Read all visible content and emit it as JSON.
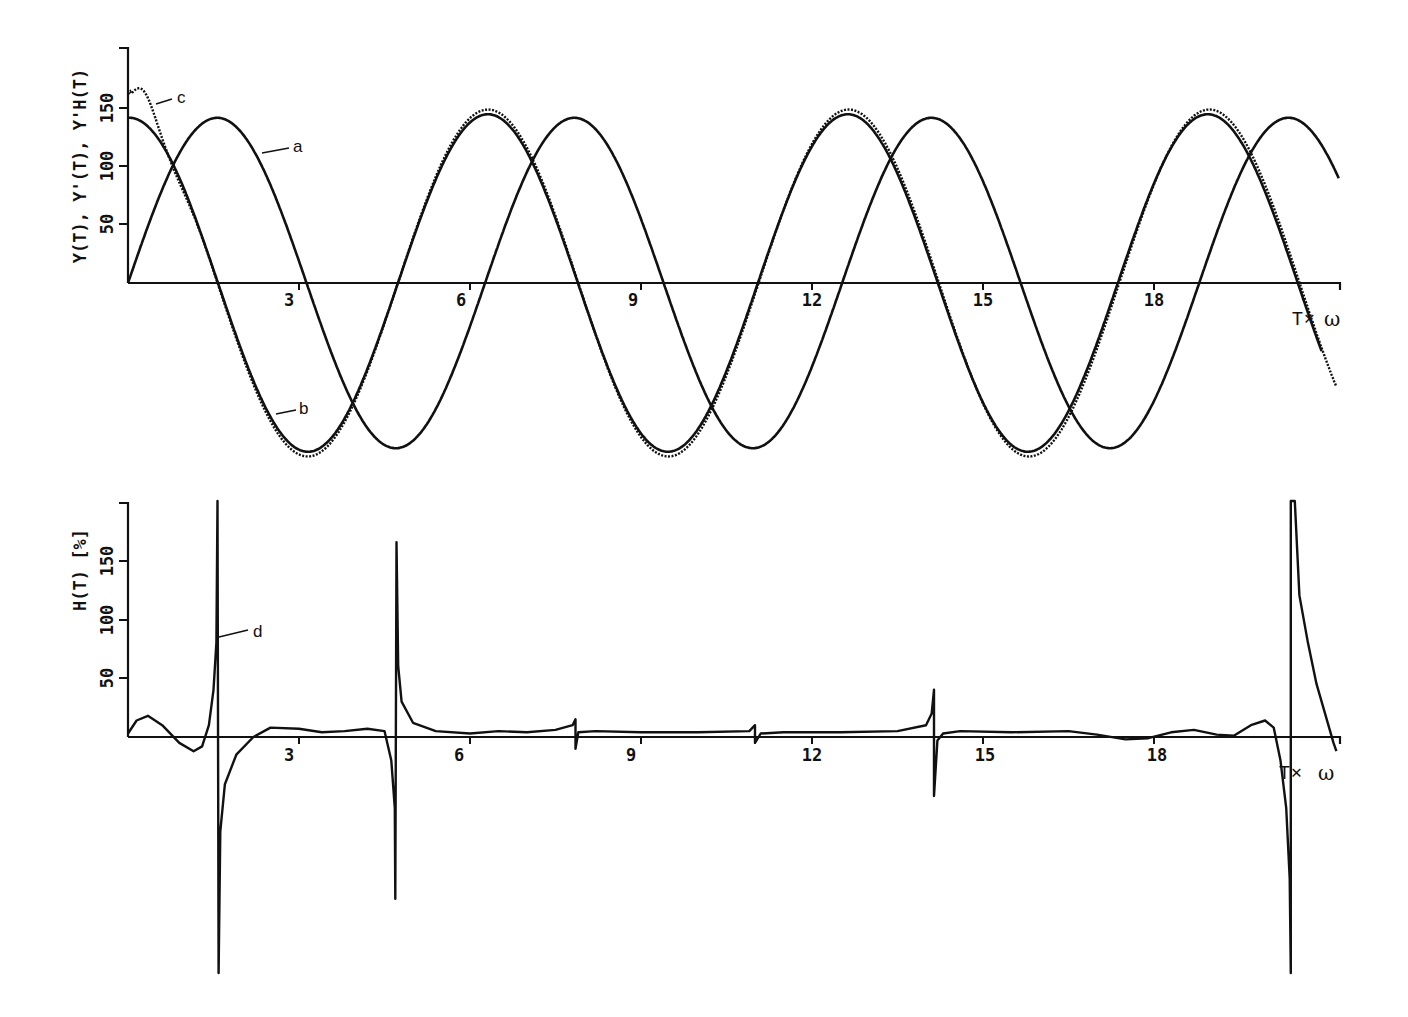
{
  "figure": {
    "top_panel": {
      "ylabel": "Y(T), Y'(T), Y'H(T)",
      "xlabel_left": "T",
      "xlabel_op": "✕",
      "xlabel_right": "ω",
      "yticks": [
        "50",
        "100",
        "150"
      ],
      "xticks": [
        "3",
        "6",
        "9",
        "12",
        "15",
        "18"
      ],
      "curve_labels": {
        "a": "a",
        "b": "b",
        "c": "c"
      }
    },
    "bottom_panel": {
      "ylabel": "H(T) [%]",
      "xlabel_left": "T",
      "xlabel_op": "✕",
      "xlabel_right": "ω",
      "yticks": [
        "50",
        "100",
        "150"
      ],
      "xticks": [
        "3",
        "6",
        "9",
        "12",
        "15",
        "18"
      ],
      "curve_labels": {
        "d": "d"
      }
    }
  },
  "chart_data": [
    {
      "type": "line",
      "title": "",
      "xlabel": "T × ω",
      "ylabel": "Y(T), Y'(T), Y'H(T)",
      "xlim": [
        0,
        21.3
      ],
      "ylim": [
        -150,
        200
      ],
      "xticks": [
        3,
        6,
        9,
        12,
        15,
        18
      ],
      "yticks": [
        50,
        100,
        150
      ],
      "grid": false,
      "legend": "inline labels a, b, c",
      "series": [
        {
          "name": "a",
          "style": "solid",
          "description": "≈ 140·sin(t)",
          "amplitude": 140,
          "x": [
            0,
            1.57,
            3.14,
            4.71,
            6.28,
            7.85,
            9.42,
            11.0,
            12.57,
            14.14,
            15.71,
            17.28,
            18.85,
            20.42,
            21.2
          ],
          "y": [
            0,
            140,
            0,
            -140,
            0,
            140,
            0,
            -140,
            0,
            140,
            0,
            -140,
            0,
            140,
            118
          ]
        },
        {
          "name": "b",
          "style": "solid",
          "description": "≈ 140·cos(t), peaks ≈ 140–145",
          "amplitude": 143,
          "x": [
            0,
            1.57,
            3.2,
            4.71,
            6.35,
            7.85,
            9.45,
            11.0,
            12.6,
            14.14,
            15.75,
            17.28,
            18.9,
            20.42,
            21.2
          ],
          "y": [
            140,
            0,
            -143,
            0,
            143,
            0,
            -143,
            0,
            143,
            0,
            -143,
            0,
            143,
            0,
            -60
          ]
        },
        {
          "name": "c",
          "style": "dotted",
          "description": "approximation, overshoot at start ≈ 160",
          "x": [
            0,
            0.25,
            0.6,
            1.57,
            3.2,
            4.71,
            6.3,
            7.85,
            9.4,
            11.0,
            12.55,
            14.14,
            15.7,
            17.28,
            18.8,
            20.42,
            21.2
          ],
          "y": [
            150,
            160,
            140,
            0,
            -148,
            0,
            147,
            0,
            -147,
            0,
            147,
            0,
            -147,
            0,
            147,
            0,
            -75
          ]
        }
      ]
    },
    {
      "type": "line",
      "title": "",
      "xlabel": "T × ω",
      "ylabel": "H(T) [%]",
      "xlim": [
        0,
        21.3
      ],
      "ylim": [
        -200,
        200
      ],
      "xticks": [
        3,
        6,
        9,
        12,
        15,
        18
      ],
      "yticks": [
        50,
        100,
        150
      ],
      "grid": false,
      "legend": "inline label d",
      "series": [
        {
          "name": "d",
          "style": "solid",
          "description": "relative error with singular spikes at odd multiples of π/2",
          "spikes": [
            {
              "x": 1.57,
              "max": 200,
              "min": -200
            },
            {
              "x": 4.71,
              "max": 165,
              "min": -137
            },
            {
              "x": 7.85,
              "max": 15,
              "min": -10
            },
            {
              "x": 11.0,
              "max": 10,
              "min": -5
            },
            {
              "x": 14.14,
              "max": 40,
              "min": -50
            },
            {
              "x": 20.42,
              "max": 200,
              "min": -200
            }
          ],
          "x": [
            0,
            0.35,
            0.9,
            1.3,
            1.5,
            1.65,
            2.2,
            3.0,
            3.5,
            4.0,
            4.5,
            4.9,
            6.0,
            7.0,
            7.8,
            8.0,
            9.0,
            10.0,
            10.9,
            11.1,
            13.0,
            14.0,
            14.3,
            16.0,
            17.0,
            17.5,
            18.5,
            19.5,
            19.8,
            20.3,
            20.6,
            21.2
          ],
          "y": [
            3,
            18,
            -5,
            -12,
            60,
            -80,
            8,
            5,
            6,
            8,
            2,
            55,
            5,
            7,
            12,
            5,
            4,
            5,
            6,
            4,
            4,
            5,
            6,
            5,
            0,
            -2,
            7,
            10,
            14,
            -60,
            170,
            -10
          ]
        }
      ]
    }
  ]
}
